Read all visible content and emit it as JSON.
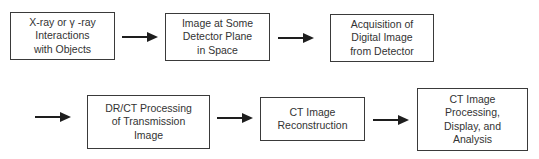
{
  "diagram": {
    "type": "flowchart",
    "rows": 2,
    "nodes": [
      {
        "id": "n1",
        "label": "X-ray or γ -ray\nInteractions\nwith Objects"
      },
      {
        "id": "n2",
        "label": "Image at Some\nDetector Plane\nin Space"
      },
      {
        "id": "n3",
        "label": "Acquisition of\nDigital Image\nfrom Detector"
      },
      {
        "id": "n4",
        "label": "DR/CT Processing\nof Transmission\nImage"
      },
      {
        "id": "n5",
        "label": "CT Image\nReconstruction"
      },
      {
        "id": "n6",
        "label": "CT Image\nProcessing,\nDisplay, and\nAnalysis"
      }
    ],
    "edges": [
      {
        "from": "n1",
        "to": "n2"
      },
      {
        "from": "n2",
        "to": "n3"
      },
      {
        "from": "n3",
        "to": "n4"
      },
      {
        "from": "n4",
        "to": "n5"
      },
      {
        "from": "n5",
        "to": "n6"
      }
    ],
    "colors": {
      "stroke": "#3a3a3a",
      "arrow": "#1e1e1e",
      "text": "#333333",
      "background": "#ffffff"
    }
  }
}
